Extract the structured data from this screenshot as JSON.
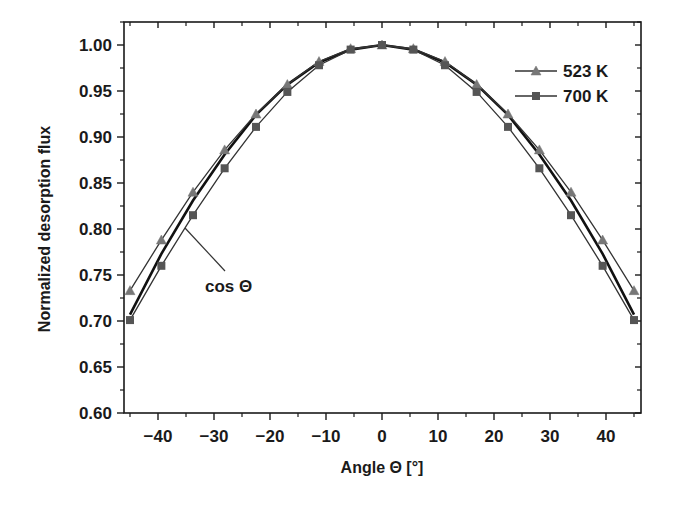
{
  "chart_data": {
    "type": "line",
    "title": "",
    "xlabel": "Angle Θ [°]",
    "ylabel": "Normalized desorption flux",
    "xlim": [
      -46,
      46
    ],
    "ylim": [
      0.6,
      1.02
    ],
    "grid": false,
    "legend_position": "upper right",
    "x_ticks": [
      -40,
      -30,
      -20,
      -10,
      0,
      10,
      20,
      30,
      40
    ],
    "x_tick_labels": [
      "−40",
      "−30",
      "−20",
      "−10",
      "0",
      "10",
      "20",
      "30",
      "40"
    ],
    "y_ticks": [
      0.6,
      0.65,
      0.7,
      0.75,
      0.8,
      0.85,
      0.9,
      0.95,
      1.0
    ],
    "y_tick_labels": [
      "0.60",
      "0.65",
      "0.70",
      "0.75",
      "0.80",
      "0.85",
      "0.90",
      "0.95",
      "1.00"
    ],
    "x": [
      -45,
      -39.4,
      -33.75,
      -28.1,
      -22.5,
      -16.9,
      -11.25,
      -5.6,
      0,
      5.6,
      11.25,
      16.9,
      22.5,
      28.1,
      33.75,
      39.4,
      45
    ],
    "series": [
      {
        "name": "523 K",
        "marker": "triangle",
        "color": "#777777",
        "values": [
          0.733,
          0.788,
          0.84,
          0.886,
          0.925,
          0.957,
          0.982,
          0.996,
          1.0,
          0.996,
          0.982,
          0.957,
          0.925,
          0.886,
          0.84,
          0.788,
          0.733
        ]
      },
      {
        "name": "700 K",
        "marker": "square",
        "color": "#555555",
        "values": [
          0.701,
          0.76,
          0.815,
          0.866,
          0.911,
          0.949,
          0.978,
          0.995,
          1.0,
          0.995,
          0.978,
          0.949,
          0.911,
          0.866,
          0.815,
          0.76,
          0.701
        ]
      },
      {
        "name": "cos Θ",
        "marker": "none",
        "color": "#111111",
        "values": [
          0.707,
          0.773,
          0.831,
          0.881,
          0.924,
          0.957,
          0.981,
          0.995,
          1.0,
          0.995,
          0.981,
          0.957,
          0.924,
          0.881,
          0.831,
          0.773,
          0.707
        ]
      }
    ],
    "annotations": [
      {
        "text": "cos Θ",
        "points_to": "cos Θ curve near -32°"
      }
    ]
  }
}
